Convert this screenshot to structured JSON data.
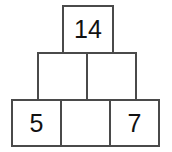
{
  "figure": {
    "name": "number-pyramid",
    "background_color": "#ffffff",
    "border_color": "#4a4a4a",
    "text_color": "#111111",
    "rows": [
      {
        "row_name": "top",
        "cells": [
          {
            "label": "14",
            "filled": true
          }
        ]
      },
      {
        "row_name": "middle",
        "cells": [
          {
            "label": "",
            "filled": false
          },
          {
            "label": "",
            "filled": false
          }
        ]
      },
      {
        "row_name": "bottom",
        "cells": [
          {
            "label": "5",
            "filled": true
          },
          {
            "label": "",
            "filled": false
          },
          {
            "label": "7",
            "filled": true
          }
        ]
      }
    ]
  }
}
